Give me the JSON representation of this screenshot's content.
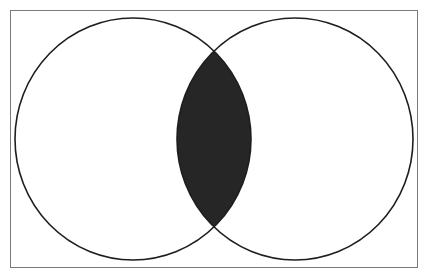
{
  "diagram": {
    "type": "venn-two-set-intersection",
    "canvas": {
      "width": 426,
      "height": 276,
      "background": "#ffffff"
    },
    "frame": {
      "x": 10.5,
      "y": 10.5,
      "width": 407,
      "height": 257,
      "stroke": "#7a7a7a",
      "stroke_width": 1
    },
    "sets": [
      {
        "id": "A",
        "cx": 133,
        "cy": 139,
        "rx": 118,
        "ry": 121,
        "stroke": "#1e1e1e",
        "stroke_width": 1.6,
        "fill": "none"
      },
      {
        "id": "B",
        "cx": 295,
        "cy": 139,
        "rx": 118,
        "ry": 121,
        "stroke": "#1e1e1e",
        "stroke_width": 1.6,
        "fill": "none"
      }
    ],
    "shaded_region": {
      "description": "A ∩ B",
      "fill": "#262626"
    }
  }
}
